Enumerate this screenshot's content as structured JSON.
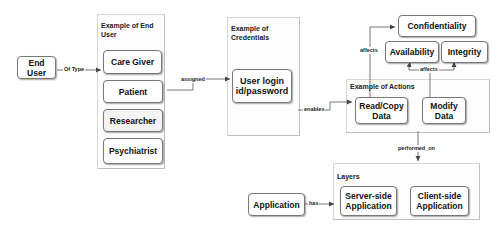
{
  "nodes": {
    "end_user": "End User",
    "care_giver": "Care Giver",
    "patient": "Patient",
    "researcher": "Researcher",
    "psychiatrist": "Psychiatrist",
    "credentials": "User login id/password",
    "confidentiality": "Confidentiality",
    "availability": "Availability",
    "integrity": "Integrity",
    "read_copy": "Read/Copy Data",
    "modify": "Modify Data",
    "application": "Application",
    "server_side": "Server-side Application",
    "client_side": "Client-side Application"
  },
  "groups": {
    "end_user_examples": "Example of End User",
    "credentials_examples": "Example of Credentials",
    "actions_examples": "Example of Actions",
    "layers": "Layers"
  },
  "edges": {
    "of_type": "Of Type",
    "assigned": "assigned",
    "enables": "enables",
    "affects_left": "affects",
    "affects_bottom": "affects",
    "performed_on": "performed_on",
    "has": "has"
  },
  "colors": {
    "line": "#555555",
    "node_border": "#777777",
    "group_border": "#d6d6d6"
  }
}
